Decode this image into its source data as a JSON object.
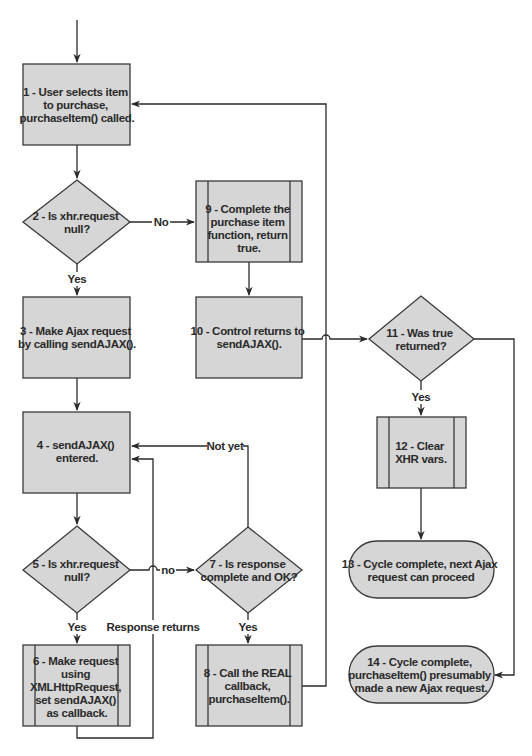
{
  "colors": {
    "shape_fill": "#d6d6d6",
    "stroke": "#3a3a3a",
    "background": "#ffffff",
    "text": "#2a2a2a"
  },
  "nodes": {
    "n1": {
      "type": "process",
      "lines": [
        "1 - User selects item",
        "to purchase,",
        "purchaseItem() called."
      ]
    },
    "n2": {
      "type": "decision",
      "lines": [
        "2 - Is xhr.request",
        "null?"
      ]
    },
    "n3": {
      "type": "process",
      "lines": [
        "3 - Make Ajax request",
        "by calling sendAJAX()."
      ]
    },
    "n4": {
      "type": "process",
      "lines": [
        "4 - sendAJAX()",
        "entered."
      ]
    },
    "n5": {
      "type": "decision",
      "lines": [
        "5 - Is xhr.request",
        "null?"
      ]
    },
    "n6": {
      "type": "subprocess",
      "lines": [
        "6 - Make request",
        "using",
        "XMLHttpRequest,",
        "set sendAJAX()",
        "as callback."
      ]
    },
    "n7": {
      "type": "decision",
      "lines": [
        "7 - Is response",
        "complete and OK?"
      ]
    },
    "n8": {
      "type": "subprocess",
      "lines": [
        "8 - Call the REAL",
        "callback,",
        "purchaseItem()."
      ]
    },
    "n9": {
      "type": "subprocess",
      "lines": [
        "9 - Complete the",
        "purchase item",
        "function, return",
        "true."
      ]
    },
    "n10": {
      "type": "process",
      "lines": [
        "10 - Control returns to",
        "sendAJAX()."
      ]
    },
    "n11": {
      "type": "decision",
      "lines": [
        "11 - Was true",
        "returned?"
      ]
    },
    "n12": {
      "type": "subprocess",
      "lines": [
        "12 - Clear",
        "XHR vars."
      ]
    },
    "n13": {
      "type": "terminator",
      "lines": [
        "13 - Cycle complete, next Ajax",
        "request can proceed"
      ]
    },
    "n14": {
      "type": "terminator",
      "lines": [
        "14 - Cycle complete,",
        "purchaseItem() presumably",
        "made a new Ajax request."
      ]
    }
  },
  "edge_labels": {
    "n2_no": "No",
    "n2_yes": "Yes",
    "n5_yes": "Yes",
    "n5_no": "no",
    "n7_yes": "Yes",
    "n7_not_yet": "Not yet",
    "response_returns": "Response returns",
    "n11_yes": "Yes"
  },
  "edges": [
    {
      "from": "start",
      "to": "n1"
    },
    {
      "from": "n1",
      "to": "n2"
    },
    {
      "from": "n2",
      "to": "n3",
      "label": "Yes"
    },
    {
      "from": "n2",
      "to": "n9",
      "label": "No"
    },
    {
      "from": "n9",
      "to": "n10"
    },
    {
      "from": "n10",
      "to": "n11"
    },
    {
      "from": "n3",
      "to": "n4"
    },
    {
      "from": "n4",
      "to": "n5"
    },
    {
      "from": "n5",
      "to": "n6",
      "label": "Yes"
    },
    {
      "from": "n5",
      "to": "n7",
      "label": "no"
    },
    {
      "from": "n6",
      "to": "n4",
      "label": "Response returns"
    },
    {
      "from": "n7",
      "to": "n4",
      "label": "Not yet"
    },
    {
      "from": "n7",
      "to": "n8",
      "label": "Yes"
    },
    {
      "from": "n8",
      "to": "n1"
    },
    {
      "from": "n11",
      "to": "n12",
      "label": "Yes"
    },
    {
      "from": "n11",
      "to": "n14"
    },
    {
      "from": "n12",
      "to": "n13"
    }
  ]
}
